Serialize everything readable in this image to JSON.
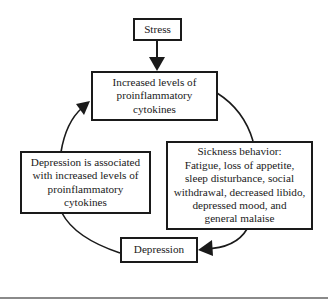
{
  "diagram": {
    "type": "cycle-flowchart",
    "nodes": {
      "stress": {
        "lines": [
          "Stress"
        ]
      },
      "cytokines": {
        "lines": [
          "Increased levels of",
          "proinflammatory",
          "cytokines"
        ]
      },
      "sickness": {
        "lines": [
          "Sickness behavior:",
          "Fatigue, loss of appetite,",
          "sleep disturbance, social",
          "withdrawal, decreased libido,",
          "depressed mood, and",
          "general malaise"
        ]
      },
      "depression": {
        "lines": [
          "Depression"
        ]
      },
      "association": {
        "lines": [
          "Depression is associated",
          "with increased levels of",
          "proinflammatory",
          "cytokines"
        ]
      }
    },
    "edges": [
      {
        "from": "stress",
        "to": "cytokines",
        "style": "straight-arrow"
      },
      {
        "from": "cytokines",
        "to": "sickness",
        "style": "curved-line"
      },
      {
        "from": "sickness",
        "to": "depression",
        "style": "curved-arrow"
      },
      {
        "from": "depression",
        "to": "association",
        "style": "curved-line"
      },
      {
        "from": "association",
        "to": "cytokines",
        "style": "curved-arrow"
      }
    ],
    "colors": {
      "stroke": "#1a1a1a",
      "rule": "#8a8a8a",
      "background": "#ffffff"
    }
  }
}
